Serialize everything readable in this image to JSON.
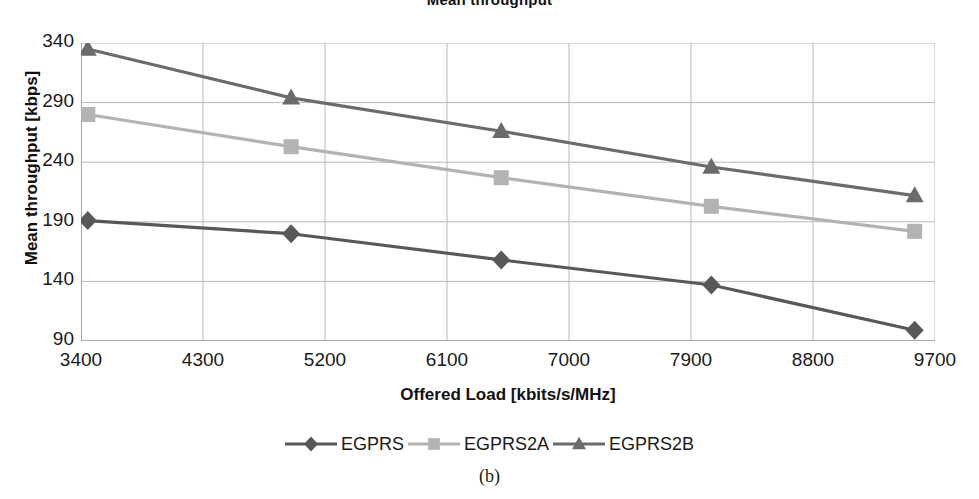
{
  "chart_data": {
    "type": "line",
    "title": "Mean throughput",
    "xlabel": "Offered Load [kbits/s/MHz]",
    "ylabel": "Mean throughput [kbps]",
    "xlim": [
      3400,
      9700
    ],
    "ylim": [
      90,
      340
    ],
    "xticks": [
      3400,
      4300,
      5200,
      6100,
      7000,
      7900,
      8800,
      9700
    ],
    "yticks": [
      90,
      140,
      190,
      240,
      290,
      340
    ],
    "grid": true,
    "legend_position": "bottom",
    "x": [
      3450,
      4950,
      6500,
      8050,
      9550
    ],
    "series": [
      {
        "name": "EGPRS",
        "marker": "diamond",
        "color": "#58585a",
        "values": [
          191,
          180,
          158,
          137,
          99
        ]
      },
      {
        "name": "EGPRS2A",
        "marker": "square",
        "color": "#b3b3b3",
        "values": [
          280,
          253,
          227,
          203,
          182
        ]
      },
      {
        "name": "EGPRS2B",
        "marker": "triangle",
        "color": "#6b6b6d",
        "values": [
          335,
          294,
          266,
          236,
          212
        ]
      }
    ]
  },
  "caption": "(b)",
  "legend": {
    "items": [
      {
        "label": "EGPRS"
      },
      {
        "label": "EGPRS2A"
      },
      {
        "label": "EGPRS2B"
      }
    ]
  }
}
